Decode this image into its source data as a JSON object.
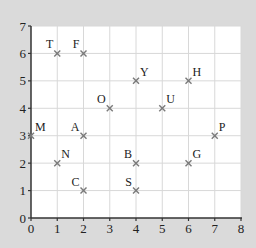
{
  "chart_data": {
    "type": "scatter",
    "title": "",
    "xlabel": "",
    "ylabel": "",
    "xlim": [
      0,
      8
    ],
    "ylim": [
      0,
      7
    ],
    "grid": true,
    "x_ticks": [
      "0",
      "1",
      "2",
      "3",
      "4",
      "5",
      "6",
      "7",
      "8"
    ],
    "y_ticks": [
      "0",
      "1",
      "2",
      "3",
      "4",
      "5",
      "6",
      "7"
    ],
    "points": [
      {
        "label": "T",
        "x": 1,
        "y": 6
      },
      {
        "label": "F",
        "x": 2,
        "y": 6
      },
      {
        "label": "Y",
        "x": 4,
        "y": 5
      },
      {
        "label": "H",
        "x": 6,
        "y": 5
      },
      {
        "label": "O",
        "x": 3,
        "y": 4
      },
      {
        "label": "U",
        "x": 5,
        "y": 4
      },
      {
        "label": "M",
        "x": 0,
        "y": 3
      },
      {
        "label": "A",
        "x": 2,
        "y": 3
      },
      {
        "label": "P",
        "x": 7,
        "y": 3
      },
      {
        "label": "N",
        "x": 1,
        "y": 2
      },
      {
        "label": "B",
        "x": 4,
        "y": 2
      },
      {
        "label": "G",
        "x": 6,
        "y": 2
      },
      {
        "label": "C",
        "x": 2,
        "y": 1
      },
      {
        "label": "S",
        "x": 4,
        "y": 1
      }
    ]
  },
  "colors": {
    "background": "#dadada",
    "plot_area": "#ffffff",
    "grid": "#d8d8d8",
    "axis": "#333333",
    "marker": "#7a7a7a",
    "text": "#222222"
  }
}
